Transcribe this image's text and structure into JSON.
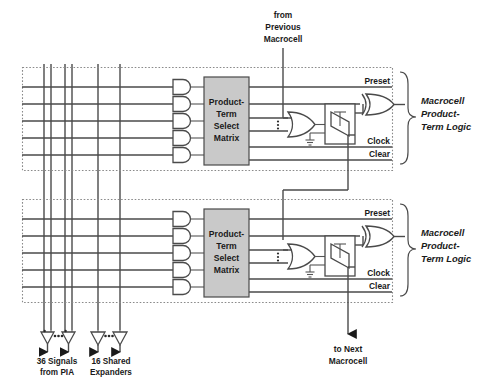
{
  "diagram": {
    "colors": {
      "matrix_fill": "#c9c9c9",
      "wire": "#4a4a4a",
      "dashed_border": "#8a8a8a",
      "text": "#1a1a1a",
      "background": "#ffffff"
    }
  },
  "annotations": {
    "from_previous_line1": "from",
    "from_previous_line2": "Previous",
    "from_previous_line3": "Macrocell",
    "to_next_line1": "to Next",
    "to_next_line2": "Macrocell"
  },
  "inputs": {
    "pia_line1": "36 Signals",
    "pia_line2": "from PIA",
    "expanders_line1": "16 Shared",
    "expanders_line2": "Expanders"
  },
  "matrix": {
    "line1": "Product-",
    "line2": "Term",
    "line3": "Select",
    "line4": "Matrix"
  },
  "macrocells": [
    {
      "id": "macrocell-top",
      "signals": {
        "preset": "Preset",
        "clock": "Clock",
        "clear": "Clear"
      },
      "brace_label": {
        "line1": "Macrocell",
        "line2": "Product-",
        "line3": "Term Logic"
      }
    },
    {
      "id": "macrocell-bottom",
      "signals": {
        "preset": "Preset",
        "clock": "Clock",
        "clear": "Clear"
      },
      "brace_label": {
        "line1": "Macrocell",
        "line2": "Product-",
        "line3": "Term Logic"
      }
    }
  ],
  "counts": {
    "and_gates_per_macrocell": 5,
    "vertical_buses": 6,
    "horizontal_rows_per_macrocell": 5
  }
}
